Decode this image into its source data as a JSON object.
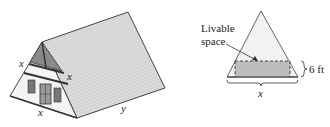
{
  "house": {
    "label_left_side": "x",
    "label_right_side": "x",
    "label_base": "x",
    "label_length": "y"
  },
  "cross_section": {
    "livable_line1": "Livable",
    "livable_line2": "space",
    "height_label": "6 ft",
    "base_label": "x"
  },
  "colors": {
    "roof": "#d9d9d9",
    "triangle_fill": "#f2f2f2",
    "livable_fill": "#bdbdbd",
    "stroke": "#333333"
  }
}
